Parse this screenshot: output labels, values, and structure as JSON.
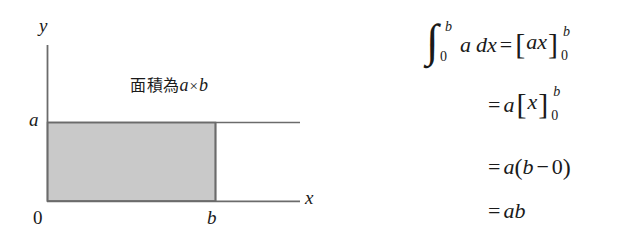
{
  "figure": {
    "caption": {
      "cjk_text": "面積為",
      "var_a": "a",
      "times": "×",
      "var_b": "b"
    },
    "labels": {
      "y_axis": "y",
      "x_axis": "x",
      "height_a": "a",
      "width_b": "b",
      "origin": "0"
    },
    "colors": {
      "rectangle_fill": "#c9c9c9",
      "rectangle_stroke": "#6b6b6b",
      "axis_stroke": "#6b6b6b",
      "background": "#ffffff",
      "text": "#1a1a1a"
    },
    "geometry": {
      "origin_x": 47,
      "origin_y": 201,
      "rect_right_x": 216,
      "rect_top_y": 122,
      "y_axis_top_y": 45,
      "x_axis_right_x": 300,
      "top_line_right_x": 300
    }
  },
  "equations": {
    "line1": {
      "integral_symbol": "∫",
      "lower_limit": "0",
      "upper_limit": "b",
      "integrand": "a",
      "differential": "dx",
      "equals": "=",
      "bracket_open": "[",
      "bracket_expr": "ax",
      "bracket_close": "]",
      "bracket_sub": "0",
      "bracket_sup": "b"
    },
    "line2": {
      "equals": "=",
      "coefficient": "a",
      "bracket_open": "[",
      "bracket_expr": "x",
      "bracket_close": "]",
      "bracket_sub": "0",
      "bracket_sup": "b"
    },
    "line3": {
      "equals": "=",
      "coefficient": "a",
      "paren_open": "(",
      "term_b": "b",
      "minus": "−",
      "term_0": "0",
      "paren_close": ")"
    },
    "line4": {
      "equals": "=",
      "result": "ab"
    }
  }
}
